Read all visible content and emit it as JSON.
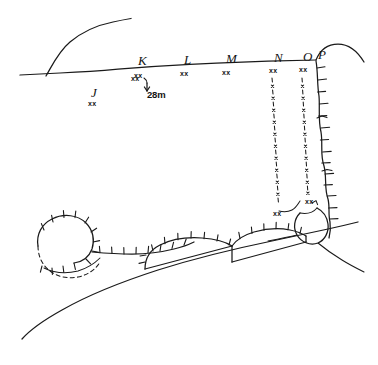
{
  "figure": {
    "kind": "hand-drawn-sketch-map",
    "background_color": "#ffffff",
    "ink_color": "#1a1a1a",
    "width": 378,
    "height": 365
  },
  "stations": [
    {
      "id": "J",
      "label": "J",
      "mark": "xx",
      "x": 91,
      "y": 93,
      "mark_x": 88,
      "mark_y": 104
    },
    {
      "id": "K",
      "label": "K",
      "mark": "xx",
      "x": 138,
      "y": 61,
      "mark_x": 134,
      "mark_y": 76
    },
    {
      "id": "L",
      "label": "L",
      "mark": "xx",
      "x": 184,
      "y": 60,
      "mark_x": 180,
      "mark_y": 74
    },
    {
      "id": "M",
      "label": "M",
      "mark": "xx",
      "x": 226,
      "y": 59,
      "mark_x": 222,
      "mark_y": 73
    },
    {
      "id": "N",
      "label": "N",
      "mark": "xx",
      "x": 274,
      "y": 58,
      "mark_x": 270,
      "mark_y": 71
    },
    {
      "id": "O",
      "label": "O",
      "mark": "xx",
      "x": 303,
      "y": 57,
      "mark_x": 299,
      "mark_y": 70
    },
    {
      "id": "P",
      "label": "P",
      "mark": "",
      "x": 318,
      "y": 56,
      "mark_x": 0,
      "mark_y": 0
    }
  ],
  "scale_bar": {
    "label": "28m",
    "label_x": 148,
    "label_y": 94,
    "tick_mark": "xx",
    "tick_mark_x": 133,
    "tick_mark_y": 79
  },
  "annotations": {
    "lower_right_mark": "xx",
    "lower_right_mark_x": 307,
    "lower_right_mark_y": 202,
    "lower_left_mark": "xx",
    "lower_left_mark_x": 275,
    "lower_left_mark_y": 214
  },
  "features": [
    {
      "name": "main-ridge-line",
      "style": "solid",
      "description": "long near-horizontal crest line crossing the upper part of the map"
    },
    {
      "name": "upper-left-slope-curve",
      "style": "solid",
      "description": "curved slope rising to the upper left"
    },
    {
      "name": "right-scarp-hachured",
      "style": "hachured",
      "description": "vertical scarp with hachure ticks on the right margin"
    },
    {
      "name": "gully-line-n",
      "style": "dash-dot-x",
      "description": "dash-and-cross gully trace descending from station N"
    },
    {
      "name": "gully-line-o",
      "style": "dash-dot-x",
      "description": "dash-and-cross gully trace descending from station O"
    },
    {
      "name": "lower-left-hook-loop",
      "style": "hachured",
      "description": "hooked loop landform, hachured on top, dashed on lower left"
    },
    {
      "name": "hachured-bench-line",
      "style": "hachured",
      "description": "hachured bench running right from the hook"
    },
    {
      "name": "terrace-cell-left",
      "style": "hachured",
      "description": "left enclosed terrace cell on the diagonal"
    },
    {
      "name": "terrace-cell-right",
      "style": "hachured",
      "description": "right enclosed terrace cell on the diagonal"
    },
    {
      "name": "lobe-outline",
      "style": "solid",
      "description": "small teardrop lobe at the foot of the scarp"
    },
    {
      "name": "lower-diagonal-curve",
      "style": "solid",
      "description": "long smooth curve sweeping from lower left to the right"
    }
  ]
}
